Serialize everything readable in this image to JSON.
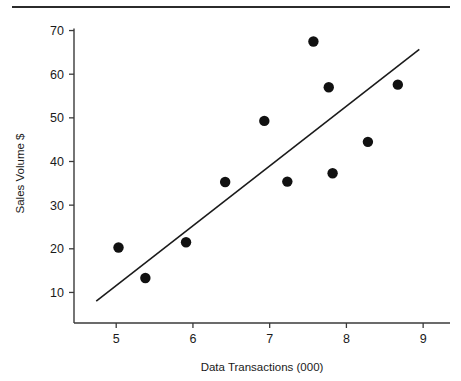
{
  "chart_data": {
    "type": "scatter",
    "title": "",
    "xlabel": "Data Transactions (000)",
    "ylabel": "Sales Volume $",
    "xlim": [
      4.45,
      9.35
    ],
    "ylim": [
      3.0,
      71.5
    ],
    "xticks": [
      5,
      6,
      7,
      8,
      9
    ],
    "xticklabels": [
      "5",
      "6",
      "7",
      "8",
      "9"
    ],
    "yticks": [
      10,
      20,
      30,
      40,
      50,
      60,
      70
    ],
    "yticklabels": [
      "10",
      "20",
      "30",
      "40",
      "50",
      "60",
      "70"
    ],
    "grid": false,
    "legend": null,
    "points": [
      {
        "x": 5.03,
        "y": 20.3
      },
      {
        "x": 5.38,
        "y": 13.3
      },
      {
        "x": 5.91,
        "y": 21.5
      },
      {
        "x": 6.42,
        "y": 35.3
      },
      {
        "x": 6.93,
        "y": 49.3
      },
      {
        "x": 7.23,
        "y": 35.4
      },
      {
        "x": 7.57,
        "y": 67.5
      },
      {
        "x": 7.77,
        "y": 57.0
      },
      {
        "x": 7.82,
        "y": 37.3
      },
      {
        "x": 8.28,
        "y": 44.5
      },
      {
        "x": 8.67,
        "y": 57.6
      }
    ],
    "trendline": {
      "type": "linear-fit",
      "x0": 4.74,
      "y0": 8.0,
      "x1": 8.95,
      "y1": 65.7
    },
    "marker": {
      "shape": "circle",
      "color": "#111111",
      "size": 5.2
    }
  },
  "figure": {
    "top_rule_visible": true,
    "background_color": "#ffffff",
    "line_color": "#1b1b1b"
  }
}
